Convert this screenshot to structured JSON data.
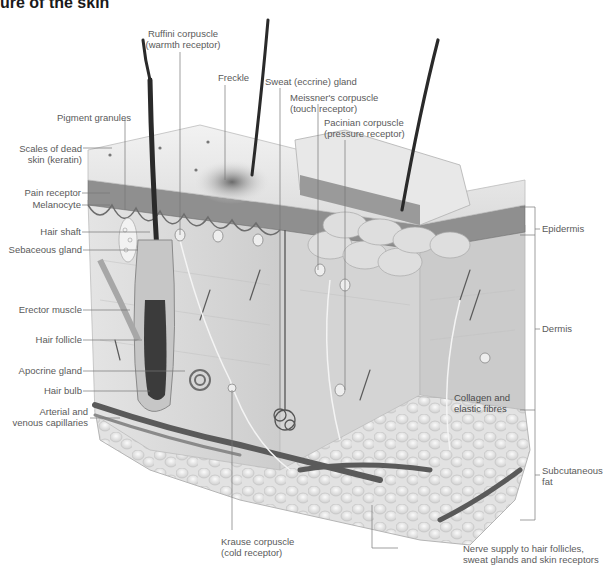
{
  "title": "ure of the skin",
  "colors": {
    "skin_surface": "#e6e6e6",
    "epidermis": "#8c8c8c",
    "dermis": "#d9d9d9",
    "fat": "#eaeaea",
    "hair": "#2a2a2a",
    "vessel": "#555555",
    "label_text": "#5a5a5a",
    "leader_line": "#777777"
  },
  "labels": {
    "left": [
      {
        "id": "pigment_granules",
        "text": "Pigment granules"
      },
      {
        "id": "scales",
        "line1": "Scales of dead",
        "line2": "skin (keratin)"
      },
      {
        "id": "pain_receptor",
        "text": "Pain receptor"
      },
      {
        "id": "melanocyte",
        "text": "Melanocyte"
      },
      {
        "id": "hair_shaft",
        "text": "Hair shaft"
      },
      {
        "id": "sebaceous_gland",
        "text": "Sebaceous gland"
      },
      {
        "id": "erector_muscle",
        "text": "Erector muscle"
      },
      {
        "id": "hair_follicle",
        "text": "Hair follicle"
      },
      {
        "id": "apocrine_gland",
        "text": "Apocrine gland"
      },
      {
        "id": "hair_bulb",
        "text": "Hair bulb"
      },
      {
        "id": "capillaries",
        "line1": "Arterial and",
        "line2": "venous capillaries"
      }
    ],
    "top": [
      {
        "id": "ruffini",
        "line1": "Ruffini corpuscle",
        "line2": "(warmth receptor)"
      },
      {
        "id": "freckle",
        "text": "Freckle"
      },
      {
        "id": "sweat_gland",
        "text": "Sweat (eccrine) gland"
      },
      {
        "id": "meissner",
        "line1": "Meissner's corpuscle",
        "line2": "(touch receptor)"
      },
      {
        "id": "pacinian",
        "line1": "Pacinian corpuscle",
        "line2": "(pressure receptor)"
      }
    ],
    "right": [
      {
        "id": "epidermis",
        "text": "Epidermis"
      },
      {
        "id": "dermis",
        "text": "Dermis"
      },
      {
        "id": "subcutaneous",
        "line1": "Subcutaneous",
        "line2": "fat"
      }
    ],
    "inner": [
      {
        "id": "collagen",
        "line1": "Collagen and",
        "line2": "elastic fibres"
      }
    ],
    "bottom": [
      {
        "id": "krause",
        "line1": "Krause corpuscle",
        "line2": "(cold receptor)"
      },
      {
        "id": "nerve_supply",
        "line1": "Nerve supply to hair follicles,",
        "line2": "sweat glands and skin receptors"
      }
    ]
  }
}
